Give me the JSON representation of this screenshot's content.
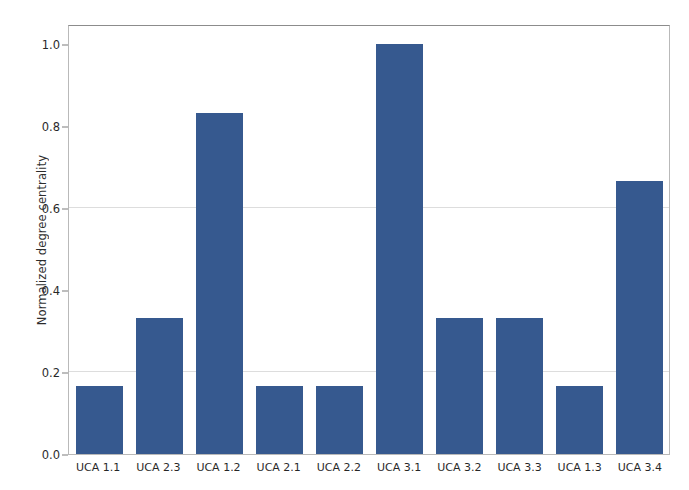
{
  "chart_data": {
    "type": "bar",
    "title": "",
    "xlabel": "",
    "ylabel": "Normalized degree centrality",
    "categories": [
      "UCA 1.1",
      "UCA 2.3",
      "UCA 1.2",
      "UCA 2.1",
      "UCA 2.2",
      "UCA 3.1",
      "UCA 3.2",
      "UCA 3.3",
      "UCA 1.3",
      "UCA 3.4"
    ],
    "values": [
      0.167,
      0.333,
      0.833,
      0.167,
      0.167,
      1.0,
      0.333,
      0.333,
      0.167,
      0.667
    ],
    "ylim": [
      0.0,
      1.05
    ],
    "ytick_labels": [
      "0.0",
      "0.2",
      "0.4",
      "0.6",
      "0.8",
      "1.0"
    ],
    "ytick_values": [
      0.0,
      0.2,
      0.4,
      0.6,
      0.8,
      1.0
    ],
    "grid": true,
    "gridline_values": [
      0.2,
      0.6
    ],
    "legend": "none",
    "bar_color": "#36598f",
    "background_color": "#ffffff",
    "axis_color": "#b9b9b9",
    "grid_color": "#d7d7d7"
  }
}
